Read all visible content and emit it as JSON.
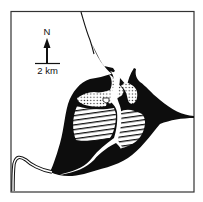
{
  "map": {
    "north_label": "N",
    "scale_label": "2 km",
    "colors": {
      "background": "#ffffff",
      "ink": "#0d0d0d",
      "frame": "#333333"
    },
    "legend_patterns": [
      {
        "name": "solid-black-area",
        "fill": "solid"
      },
      {
        "name": "stippled-area",
        "fill": "dots"
      },
      {
        "name": "hatched-area",
        "fill": "horizontal-lines"
      },
      {
        "name": "river-channel",
        "fill": "white-channel"
      }
    ]
  }
}
